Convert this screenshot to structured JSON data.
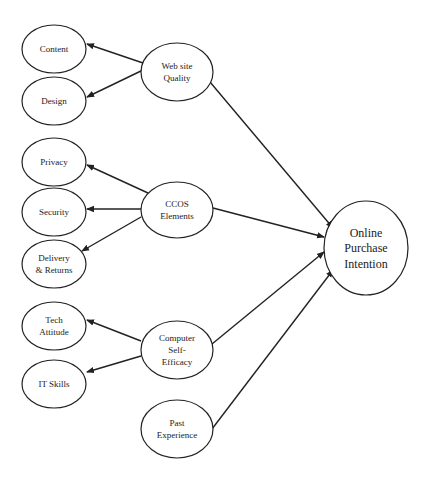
{
  "diagram": {
    "type": "research-model",
    "colors": {
      "stroke": "#222222",
      "background": "#ffffff",
      "text": "#222222"
    },
    "nodes": [
      {
        "id": "content",
        "lines": [
          "Content"
        ],
        "cx": 54,
        "cy": 49,
        "rx": 32,
        "ry": 24,
        "font_size": 9
      },
      {
        "id": "design",
        "lines": [
          "Design"
        ],
        "cx": 54,
        "cy": 101,
        "rx": 32,
        "ry": 24,
        "font_size": 9
      },
      {
        "id": "web-site-quality",
        "lines": [
          "Web site",
          "Quality"
        ],
        "cx": 177,
        "cy": 72,
        "rx": 36,
        "ry": 29,
        "font_size": 9
      },
      {
        "id": "privacy",
        "lines": [
          "Privacy"
        ],
        "cx": 54,
        "cy": 162,
        "rx": 32,
        "ry": 24,
        "font_size": 9
      },
      {
        "id": "security",
        "lines": [
          "Security"
        ],
        "cx": 54,
        "cy": 212,
        "rx": 32,
        "ry": 24,
        "font_size": 9
      },
      {
        "id": "delivery-returns",
        "lines": [
          "Delivery",
          "& Returns"
        ],
        "cx": 54,
        "cy": 264,
        "rx": 32,
        "ry": 24,
        "font_size": 9
      },
      {
        "id": "ccos-elements",
        "lines": [
          "CCOS",
          "Elements"
        ],
        "cx": 177,
        "cy": 210,
        "rx": 36,
        "ry": 28,
        "font_size": 9
      },
      {
        "id": "tech-attitude",
        "lines": [
          "Tech",
          "Attitude"
        ],
        "cx": 54,
        "cy": 326,
        "rx": 32,
        "ry": 24,
        "font_size": 9
      },
      {
        "id": "it-skills",
        "lines": [
          "IT Skills"
        ],
        "cx": 54,
        "cy": 384,
        "rx": 32,
        "ry": 24,
        "font_size": 9
      },
      {
        "id": "computer-self-efficacy",
        "lines": [
          "Computer",
          "Self-",
          "Efficacy"
        ],
        "cx": 177,
        "cy": 350,
        "rx": 36,
        "ry": 29,
        "font_size": 9
      },
      {
        "id": "past-experience",
        "lines": [
          "Past",
          "Experience"
        ],
        "cx": 177,
        "cy": 429,
        "rx": 36,
        "ry": 29,
        "font_size": 9
      },
      {
        "id": "online-purchase-intention",
        "lines": [
          "Online",
          "Purchase",
          "Intention"
        ],
        "cx": 366,
        "cy": 248,
        "rx": 42,
        "ry": 47,
        "font_size": 12
      }
    ],
    "edges": [
      {
        "from": "web-site-quality",
        "to": "content",
        "x1": 143,
        "y1": 63,
        "x2": 87,
        "y2": 44
      },
      {
        "from": "web-site-quality",
        "to": "design",
        "x1": 143,
        "y1": 70,
        "x2": 87,
        "y2": 97
      },
      {
        "from": "ccos-elements",
        "to": "privacy",
        "x1": 148,
        "y1": 193,
        "x2": 87,
        "y2": 165
      },
      {
        "from": "ccos-elements",
        "to": "security",
        "x1": 141,
        "y1": 209,
        "x2": 87,
        "y2": 209
      },
      {
        "from": "ccos-elements",
        "to": "delivery-returns",
        "x1": 141,
        "y1": 217,
        "x2": 82,
        "y2": 251
      },
      {
        "from": "computer-self-efficacy",
        "to": "tech-attitude",
        "x1": 141,
        "y1": 341,
        "x2": 87,
        "y2": 320
      },
      {
        "from": "computer-self-efficacy",
        "to": "it-skills",
        "x1": 141,
        "y1": 356,
        "x2": 87,
        "y2": 372
      },
      {
        "from": "web-site-quality",
        "to": "online-purchase-intention",
        "x1": 210,
        "y1": 82,
        "x2": 333,
        "y2": 228
      },
      {
        "from": "ccos-elements",
        "to": "online-purchase-intention",
        "x1": 213,
        "y1": 208,
        "x2": 324,
        "y2": 237
      },
      {
        "from": "computer-self-efficacy",
        "to": "online-purchase-intention",
        "x1": 212,
        "y1": 344,
        "x2": 324,
        "y2": 252
      },
      {
        "from": "past-experience",
        "to": "online-purchase-intention",
        "x1": 212,
        "y1": 429,
        "x2": 333,
        "y2": 270
      }
    ]
  }
}
